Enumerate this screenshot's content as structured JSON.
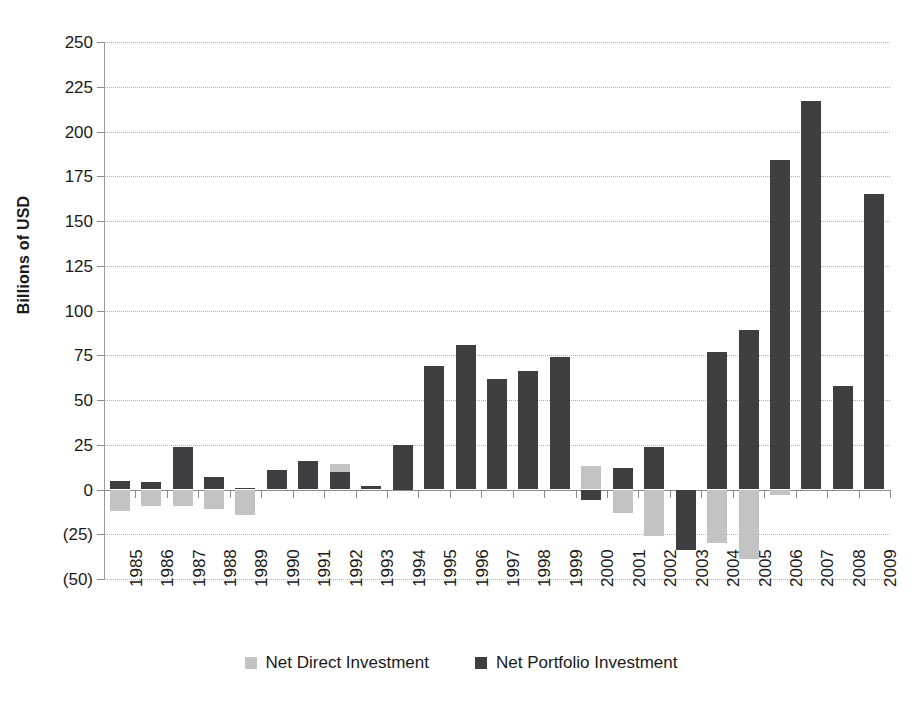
{
  "chart_data": {
    "type": "bar",
    "title": "",
    "subtitle": "",
    "xlabel": "",
    "ylabel": "Billions of USD",
    "ylim": [
      -50,
      250
    ],
    "ytick_values": [
      250,
      225,
      200,
      175,
      150,
      125,
      100,
      75,
      50,
      25,
      0,
      -25,
      -50
    ],
    "ytick_labels": [
      "250",
      "225",
      "200",
      "175",
      "150",
      "125",
      "100",
      "75",
      "50",
      "25",
      "0",
      "(25)",
      "(50)"
    ],
    "grid": true,
    "legend_position": "bottom",
    "categories": [
      "1985",
      "1986",
      "1987",
      "1988",
      "1989",
      "1990",
      "1991",
      "1992",
      "1993",
      "1994",
      "1995",
      "1996",
      "1997",
      "1998",
      "1999",
      "2000",
      "2001",
      "2002",
      "2003",
      "2004",
      "2005",
      "2006",
      "2007",
      "2008",
      "2009"
    ],
    "series": [
      {
        "name": "Net Direct Investment",
        "color": "#c3c3c3",
        "values": [
          -12,
          -9,
          -9,
          -11,
          -14,
          0,
          0,
          14,
          0,
          0,
          0,
          0,
          0,
          0,
          0,
          13,
          -13,
          -26,
          0,
          -30,
          -39,
          -3,
          0,
          0,
          0
        ]
      },
      {
        "name": "Net Portfolio Investment",
        "color": "#3f3f41",
        "values": [
          5,
          4,
          24,
          7,
          1,
          11,
          16,
          10,
          2,
          25,
          69,
          81,
          62,
          66,
          74,
          -6,
          12,
          24,
          -34,
          77,
          89,
          184,
          217,
          58,
          165
        ]
      }
    ]
  },
  "legend": {
    "items": [
      {
        "label": "Net Direct Investment",
        "swatch": "direct"
      },
      {
        "label": "Net Portfolio Investment",
        "swatch": "portfolio"
      }
    ]
  }
}
